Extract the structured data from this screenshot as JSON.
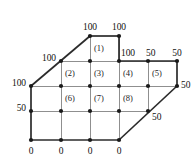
{
  "figure": {
    "type": "finite-difference-mesh",
    "colors": {
      "boundary_line": "#2b2b2b",
      "interior_line": "#8f8f8f",
      "node_fill": "#1a1a1a",
      "text": "#111111",
      "background": "#ffffff"
    },
    "grid": {
      "columns_x": [
        31,
        61,
        90,
        119,
        148,
        177
      ],
      "rows_y": [
        36,
        61,
        86,
        111,
        140
      ],
      "spacing_px": 29.5
    }
  },
  "nodes": [
    {
      "id": "n-top-1",
      "x": 90,
      "y": 36,
      "label": "100",
      "label_pos": "above"
    },
    {
      "id": "n-top-2",
      "x": 119,
      "y": 36,
      "label": "100",
      "label_pos": "above"
    },
    {
      "id": "n-r1-c1",
      "x": 61,
      "y": 61,
      "label": "100",
      "label_pos": "left"
    },
    {
      "id": "n-r1-c2",
      "x": 90,
      "y": 61,
      "label": "",
      "label_pos": ""
    },
    {
      "id": "n-r1-c3",
      "x": 119,
      "y": 61,
      "label": "100",
      "label_pos": "above"
    },
    {
      "id": "n-r1-c4",
      "x": 148,
      "y": 61,
      "label": "50",
      "label_pos": "above"
    },
    {
      "id": "n-r1-c5",
      "x": 177,
      "y": 61,
      "label": "50",
      "label_pos": "above"
    },
    {
      "id": "n-r2-c0",
      "x": 31,
      "y": 86,
      "label": "100",
      "label_pos": "left"
    },
    {
      "id": "n-r2-c1",
      "x": 61,
      "y": 86,
      "label": "",
      "label_pos": ""
    },
    {
      "id": "n-r2-c2",
      "x": 90,
      "y": 86,
      "label": "",
      "label_pos": ""
    },
    {
      "id": "n-r2-c3",
      "x": 119,
      "y": 86,
      "label": "",
      "label_pos": ""
    },
    {
      "id": "n-r2-c4",
      "x": 148,
      "y": 86,
      "label": "",
      "label_pos": ""
    },
    {
      "id": "n-r2-c5",
      "x": 177,
      "y": 86,
      "label": "50",
      "label_pos": "right"
    },
    {
      "id": "n-r3-c0",
      "x": 31,
      "y": 111,
      "label": "50",
      "label_pos": "left"
    },
    {
      "id": "n-r3-c1",
      "x": 61,
      "y": 111,
      "label": "",
      "label_pos": ""
    },
    {
      "id": "n-r3-c2",
      "x": 90,
      "y": 111,
      "label": "",
      "label_pos": ""
    },
    {
      "id": "n-r3-c3",
      "x": 119,
      "y": 111,
      "label": "",
      "label_pos": ""
    },
    {
      "id": "n-r3-c4",
      "x": 148,
      "y": 111,
      "label": "50",
      "label_pos": "right-below"
    },
    {
      "id": "n-bot-c0",
      "x": 31,
      "y": 140,
      "label": "0",
      "label_pos": "below"
    },
    {
      "id": "n-bot-c1",
      "x": 61,
      "y": 140,
      "label": "0",
      "label_pos": "below"
    },
    {
      "id": "n-bot-c2",
      "x": 90,
      "y": 140,
      "label": "0",
      "label_pos": "below"
    },
    {
      "id": "n-bot-c3",
      "x": 119,
      "y": 140,
      "label": "0",
      "label_pos": "below"
    }
  ],
  "boundary_labels": [
    {
      "name": "top-left-100",
      "text": "100",
      "x": 90,
      "y": 22,
      "align": "center"
    },
    {
      "name": "top-right-100",
      "text": "100",
      "x": 119,
      "y": 22,
      "align": "center"
    },
    {
      "name": "upper-left-100",
      "text": "100",
      "x": 56,
      "y": 53,
      "align": "right"
    },
    {
      "name": "row1-100",
      "text": "100",
      "x": 121,
      "y": 48,
      "align": "left"
    },
    {
      "name": "row1-50",
      "text": "50",
      "x": 146,
      "y": 48,
      "align": "left"
    },
    {
      "name": "row1-right-50",
      "text": "50",
      "x": 177,
      "y": 48,
      "align": "center"
    },
    {
      "name": "left-100",
      "text": "100",
      "x": 26,
      "y": 78,
      "align": "right"
    },
    {
      "name": "right-50",
      "text": "50",
      "x": 181,
      "y": 80,
      "align": "left"
    },
    {
      "name": "left-50",
      "text": "50",
      "x": 26,
      "y": 103,
      "align": "right"
    },
    {
      "name": "diagonal-50",
      "text": "50",
      "x": 152,
      "y": 112,
      "align": "left"
    },
    {
      "name": "bottom-0-a",
      "text": "0",
      "x": 31,
      "y": 146,
      "align": "center"
    },
    {
      "name": "bottom-0-b",
      "text": "0",
      "x": 61,
      "y": 146,
      "align": "center"
    },
    {
      "name": "bottom-0-c",
      "text": "0",
      "x": 90,
      "y": 146,
      "align": "center"
    },
    {
      "name": "bottom-0-d",
      "text": "0",
      "x": 119,
      "y": 146,
      "align": "center"
    }
  ],
  "cell_labels": [
    {
      "name": "cell-1",
      "text": "(1)",
      "x": 94,
      "y": 44
    },
    {
      "name": "cell-2",
      "text": "(2)",
      "x": 65,
      "y": 69
    },
    {
      "name": "cell-3",
      "text": "(3)",
      "x": 94,
      "y": 69
    },
    {
      "name": "cell-4",
      "text": "(4)",
      "x": 123,
      "y": 69
    },
    {
      "name": "cell-5",
      "text": "(5)",
      "x": 152,
      "y": 69
    },
    {
      "name": "cell-6",
      "text": "(6)",
      "x": 65,
      "y": 94
    },
    {
      "name": "cell-7",
      "text": "(7)",
      "x": 94,
      "y": 94
    },
    {
      "name": "cell-8",
      "text": "(8)",
      "x": 123,
      "y": 94
    }
  ]
}
